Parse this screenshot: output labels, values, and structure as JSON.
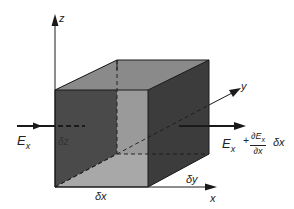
{
  "diagram": {
    "type": "3d-volume-element",
    "axes": {
      "x": "x",
      "y": "y",
      "z": "z"
    },
    "labels": {
      "dx": "δx",
      "dy": "δy",
      "dz": "δz",
      "incoming_field": "E",
      "incoming_sub": "x",
      "outgoing_field_base": "E",
      "outgoing_sub": "x",
      "plus": "+",
      "frac_num": "∂E",
      "frac_num_sub": "x",
      "frac_den": "∂x",
      "dx_factor": "δx"
    },
    "colors": {
      "front_face": "#4a4a4a",
      "right_face": "#3c3c3c",
      "top_face": "#8a8a8a",
      "back_face": "#9a9a9a",
      "bottom_face": "#a8a8a8",
      "edges": "#1a1a1a",
      "background": "#ffffff"
    }
  }
}
